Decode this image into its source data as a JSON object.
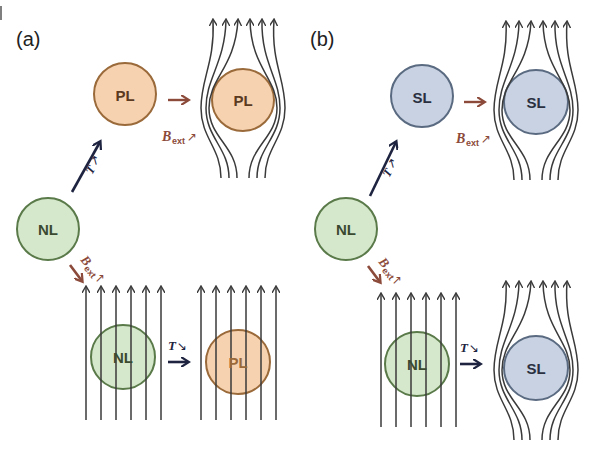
{
  "figure": {
    "panels": [
      {
        "label": "(a)",
        "nodes": {
          "start": "NL",
          "upper_state": "PL",
          "upper_final": "PL",
          "lower_state": "NL",
          "lower_final": "PL"
        },
        "arrows": {
          "diag_up": "T ↗",
          "upper_right": "B_ext ↗",
          "diag_down": "B_ext ↗",
          "lower_right": "T ↘"
        },
        "upper_final_field": "expelled",
        "lower_final_field": "penetrating"
      },
      {
        "label": "(b)",
        "nodes": {
          "start": "NL",
          "upper_state": "SL",
          "upper_final": "SL",
          "lower_state": "NL",
          "lower_final": "SL"
        },
        "arrows": {
          "diag_up": "T ↗",
          "upper_right": "B_ext ↗",
          "diag_down": "B_ext ↗",
          "lower_right": "T ↘"
        },
        "upper_final_field": "expelled",
        "lower_final_field": "expelled"
      }
    ],
    "text": {
      "T": "T",
      "B": "B",
      "ext": "ext",
      "up_arrow": "↗",
      "down_arrow": "↘"
    },
    "colors": {
      "NL_fill": "#d6e8cc",
      "NL_stroke": "#5a7a4a",
      "PL_fill": "#f6d2b0",
      "PL_stroke": "#9a6a3a",
      "SL_fill": "#c8d2e2",
      "SL_stroke": "#5a6a80",
      "T_arrow": "#1e2440",
      "B_arrow": "#8b4a3a",
      "field_line": "#3a3a3a"
    }
  }
}
